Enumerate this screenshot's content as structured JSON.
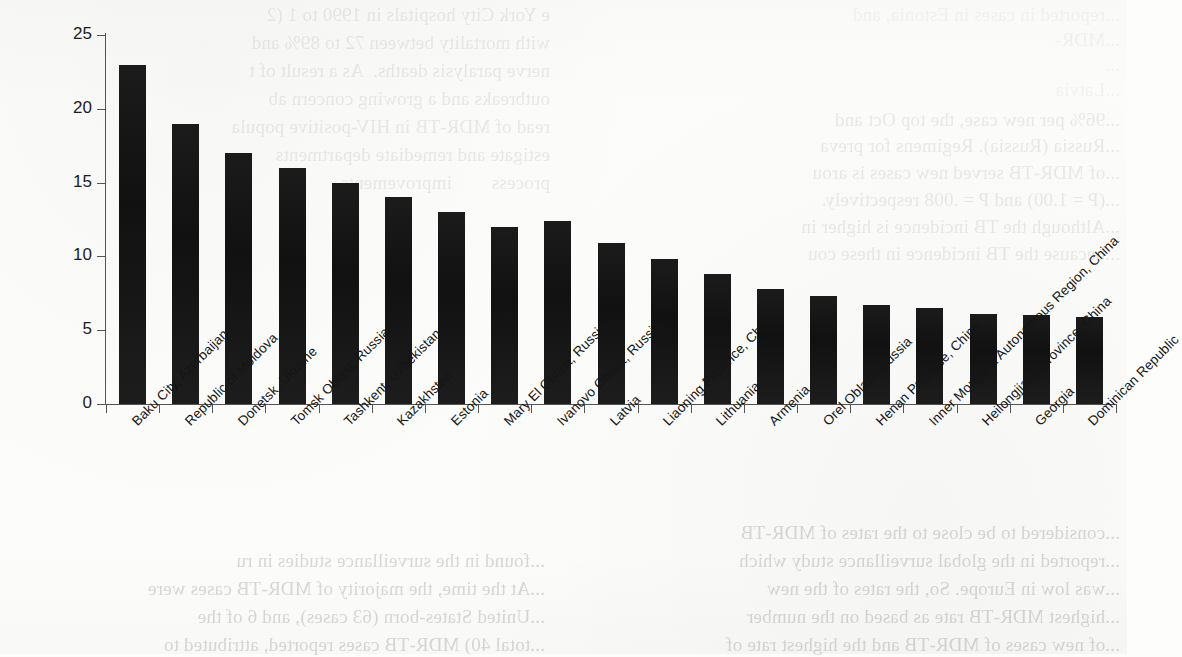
{
  "page": {
    "kind": "scanned-journal-page-figure",
    "background_color": "#fcfcfa",
    "ink_color": "#161616"
  },
  "chart_data": {
    "type": "bar",
    "title": "",
    "subtitle": "",
    "xlabel": "",
    "ylabel": "",
    "ylim": [
      0,
      25
    ],
    "yticks": [
      0,
      5,
      10,
      15,
      20,
      25
    ],
    "ytick_labels": [
      "0",
      "5",
      "10",
      "15",
      "20",
      "25"
    ],
    "grid": false,
    "legend": "none",
    "bar_color": "#161616",
    "orientation": "vertical",
    "xtick_label_rotation": -45,
    "categories": [
      "Baku City, Azerbaijan",
      "Republic of Moldova",
      "Donetsk, Ukraine",
      "Tomsk Oblast, Russia",
      "Tashkent, Uzbekistan",
      "Kazakhstan",
      "Estonia",
      "Mary El Oblast, Russia",
      "Ivanovo Oblast, Russia",
      "Latvia",
      "Liaoning Province, China",
      "Lithuania",
      "Armenia",
      "Orel Oblast, Russia",
      "Henan Province, China",
      "Inner Mongolia Autonomous Region, China",
      "Heilongjiang Province, China",
      "Georgia",
      "Dominican Republic"
    ],
    "values": [
      23.0,
      19.0,
      17.0,
      16.0,
      15.0,
      14.0,
      13.0,
      12.0,
      12.4,
      10.9,
      9.8,
      8.8,
      7.8,
      7.3,
      6.7,
      6.5,
      6.1,
      6.0,
      5.9
    ]
  },
  "bleed_text": {
    "description": "Faint mirrored show-through text from the reverse side of the scanned page",
    "top_left": [
      "e York City hospitals in 1990 to 1 (2",
      "with mortality between 72 to 89% and",
      "nerve paralysis deaths.  As a result of t",
      "outbreaks and a growing concern ab",
      "read of MDR-TB in HIV-positive popula",
      "estigate and remediate departments",
      "process        improvements"
    ],
    "top_right": [
      "...reported in cases in Estonia, and",
      "...MDR-",
      "...",
      "...Latvia",
      "...96% per new case, the top Oct and",
      "...Russia (Russia). Regimens for preva",
      "...of MDR-TB served new cases is arou",
      "...(P = 1.00) and P = .008 respectively.",
      "...Although the TB incidence is higher in",
      "...because the TB incidence in these cou"
    ],
    "bottom_left": [
      "...found in the surveillance studies in ru",
      "...At the time, the majority of MDR-TB cases were",
      "...United States-born (63 cases), and 6 of the",
      "...total 40) MDR-TB cases reported, attributed to"
    ],
    "bottom_right": [
      "...considered to be close to the rates of MDR-TB",
      "...reported in the global surveillance study which",
      "...was low in Europe. So, the rates of the new",
      "...highest MDR-TB rate as based on the number",
      "...of new cases of MDR-TB and the highest rate of",
      "...MDR-TB was recorded in the 8 FSU countries"
    ]
  }
}
